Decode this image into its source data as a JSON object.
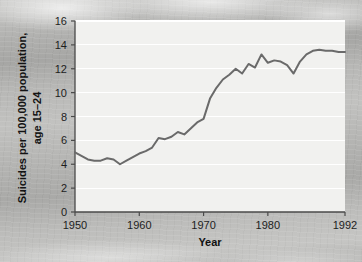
{
  "chart_data": {
    "type": "line",
    "title": "",
    "xlabel": "Year",
    "ylabel_line1": "Suicides per 100,000 population,",
    "ylabel_line2": "age 15–24",
    "ylabel": "Suicides per 100,000 population, age 15–24",
    "xlim": [
      1950,
      1992
    ],
    "ylim": [
      0,
      16
    ],
    "grid": "horizontal",
    "legend": "none",
    "x_tick_labels": [
      "1950",
      "1960",
      "1970",
      "1980",
      "1992"
    ],
    "x_ticks": [
      1950,
      1960,
      1970,
      1980,
      1992
    ],
    "y_tick_labels": [
      "0",
      "2",
      "4",
      "6",
      "8",
      "10",
      "12",
      "14",
      "16"
    ],
    "y_ticks": [
      0,
      2,
      4,
      6,
      8,
      10,
      12,
      14,
      16
    ],
    "series": [
      {
        "name": "Suicide rate, age 15-24",
        "x": [
          1950,
          1951,
          1952,
          1953,
          1954,
          1955,
          1956,
          1957,
          1958,
          1959,
          1960,
          1961,
          1962,
          1963,
          1964,
          1965,
          1966,
          1967,
          1968,
          1969,
          1970,
          1971,
          1972,
          1973,
          1974,
          1975,
          1976,
          1977,
          1978,
          1979,
          1980,
          1981,
          1982,
          1983,
          1984,
          1985,
          1986,
          1987,
          1988,
          1989,
          1990,
          1991,
          1992
        ],
        "values": [
          5.0,
          4.7,
          4.4,
          4.3,
          4.3,
          4.5,
          4.4,
          4.0,
          4.3,
          4.6,
          4.9,
          5.1,
          5.4,
          6.2,
          6.1,
          6.3,
          6.7,
          6.5,
          7.0,
          7.5,
          7.8,
          9.5,
          10.4,
          11.1,
          11.5,
          12.0,
          11.6,
          12.4,
          12.1,
          13.2,
          12.5,
          12.7,
          12.6,
          12.3,
          11.6,
          12.6,
          13.2,
          13.5,
          13.6,
          13.5,
          13.5,
          13.4,
          13.4
        ]
      }
    ],
    "colors": {
      "line": "#6a6a6a",
      "plot_background": "#f1f1ef",
      "grid": "#ffffff",
      "axis": "#4a4a4a",
      "page_background": "#b2b2b0",
      "text": "#1d1d1d"
    }
  }
}
